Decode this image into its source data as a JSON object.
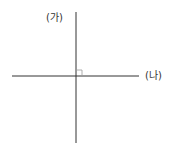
{
  "diagram": {
    "labels": {
      "vertical_axis": "(가)",
      "horizontal_axis": "(나)"
    },
    "colors": {
      "line": "#333333",
      "right_angle_marker": "#999999",
      "background": "#ffffff"
    },
    "elements": {
      "vertical_line": {
        "x": 76,
        "y1": 12,
        "y2": 143
      },
      "horizontal_line": {
        "y": 76,
        "x1": 12,
        "x2": 139
      },
      "right_angle_marker": {
        "x": 76,
        "y": 70,
        "size": 6
      }
    }
  }
}
